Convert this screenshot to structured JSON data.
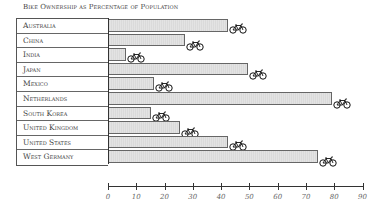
{
  "chart_data": {
    "type": "bar",
    "orientation": "horizontal",
    "title": "Bike Ownership as Percentage of Population",
    "xlabel": "",
    "ylabel": "",
    "categories": [
      "Australia",
      "China",
      "India",
      "Japan",
      "Mexico",
      "Netherlands",
      "South Korea",
      "United Kingdom",
      "United States",
      "West Germany"
    ],
    "values": [
      42,
      27,
      6,
      49,
      16,
      79,
      15,
      25,
      42,
      74
    ],
    "xlim": [
      0,
      90
    ],
    "x_ticks": [
      0,
      10,
      20,
      30,
      40,
      50,
      60,
      70,
      80,
      90
    ],
    "grid": false,
    "legend": null,
    "marker_icon": "bicycle-icon",
    "bar_color": "#e3e3e3",
    "bar_border_color": "#666666"
  }
}
